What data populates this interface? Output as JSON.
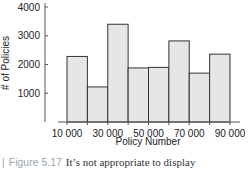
{
  "chart_data": {
    "type": "bar",
    "title": "",
    "xlabel": "Policy Number",
    "ylabel": "# of Policies",
    "x_bin_edges": [
      10000,
      20000,
      30000,
      40000,
      50000,
      60000,
      70000,
      80000,
      90000
    ],
    "categories": [
      "10000-20000",
      "20000-30000",
      "30000-40000",
      "40000-50000",
      "50000-60000",
      "60000-70000",
      "70000-80000",
      "80000-90000"
    ],
    "values": [
      2280,
      1220,
      3400,
      1880,
      1900,
      2820,
      1700,
      2360
    ],
    "x_tick_labels": [
      "10 000",
      "30 000",
      "50 000",
      "70 000",
      "90 000"
    ],
    "y_tick_labels": [
      "1000",
      "2000",
      "3000",
      "4000"
    ],
    "y_ticks": [
      1000,
      2000,
      3000,
      4000
    ],
    "ylim": [
      0,
      4200
    ],
    "xlim": [
      10000,
      90000
    ],
    "grid": false,
    "legend": null,
    "bar_fill": "#e6e6e6",
    "bar_edge": "#333333"
  },
  "caption": {
    "marker": "|",
    "figure_label": "Figure 5.17",
    "text": "It’s not appropriate to display"
  }
}
